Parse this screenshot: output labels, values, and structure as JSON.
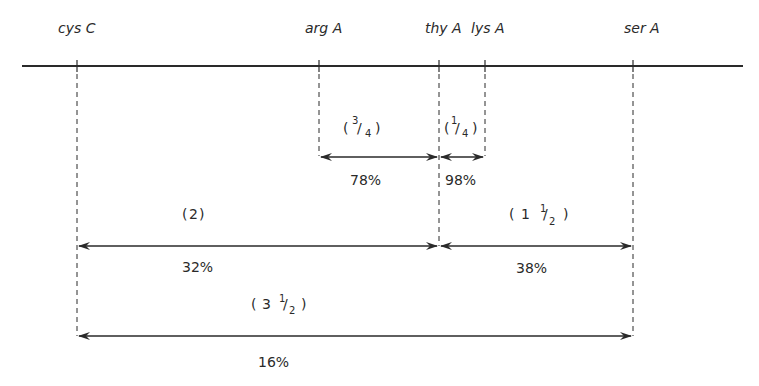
{
  "diagram": {
    "type": "genetic-map",
    "chromosome_line": {
      "x_start": 22,
      "x_end": 743,
      "y": 66
    },
    "genes": [
      {
        "name": "cys C",
        "x": 77
      },
      {
        "name": "arg A",
        "x": 319
      },
      {
        "name": "thy A",
        "x": 439
      },
      {
        "name": "lys A",
        "x": 485
      },
      {
        "name": "ser A",
        "x": 633
      }
    ],
    "intervals": [
      {
        "from": "arg A",
        "to": "thy A",
        "distance_label": "(3/4)",
        "whole": "",
        "num": "3",
        "den": "4",
        "cotransduction": "78%"
      },
      {
        "from": "thy A",
        "to": "lys A",
        "distance_label": "(1/4)",
        "whole": "",
        "num": "1",
        "den": "4",
        "cotransduction": "98%"
      },
      {
        "from": "cys C",
        "to": "thy A",
        "distance_label": "(2)",
        "whole": "2",
        "num": "",
        "den": "",
        "cotransduction": "32%"
      },
      {
        "from": "thy A",
        "to": "ser A",
        "distance_label": "(1 1/2)",
        "whole": "1",
        "num": "1",
        "den": "2",
        "cotransduction": "38%"
      },
      {
        "from": "cys C",
        "to": "ser A",
        "distance_label": "(3 1/2)",
        "whole": "3",
        "num": "1",
        "den": "2",
        "cotransduction": "16%"
      }
    ]
  }
}
